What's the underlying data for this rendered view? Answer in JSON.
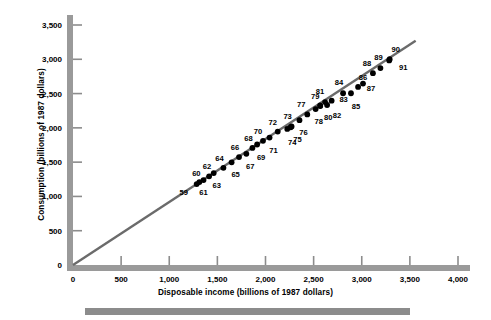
{
  "figure": {
    "x_axis_title": "Disposable income (billions of 1987 dollars)",
    "y_axis_title": "Consumption (billions of 1987 dollars)"
  },
  "colors": {
    "axis_gray": "#9a9a9a",
    "tick_gray": "#8c8c8c",
    "line_gray": "#6b6b6b",
    "marker_black": "#000000",
    "rule_gray": "#8c8c8c",
    "background": "#ffffff"
  },
  "chart_data": {
    "type": "scatter",
    "title": "",
    "xlabel": "Disposable income (billions of 1987 dollars)",
    "ylabel": "Consumption (billions of 1987 dollars)",
    "xlim": [
      0,
      4000
    ],
    "ylim": [
      0,
      3500
    ],
    "xticks": [
      0,
      500,
      1000,
      1500,
      2000,
      2500,
      3000,
      3500,
      4000
    ],
    "yticks": [
      0,
      500,
      1000,
      1500,
      2000,
      2500,
      3000,
      3500
    ],
    "xticklabels": [
      "0",
      "500",
      "1,000",
      "1,500",
      "2,000",
      "2,500",
      "3,000",
      "3,500",
      "4,000"
    ],
    "yticklabels": [
      "0",
      "500",
      "1,000",
      "1,500",
      "2,000",
      "2,500",
      "3,000",
      "3,500"
    ],
    "grid": false,
    "legend": null,
    "point_label_field": "year",
    "trendline": {
      "type": "line",
      "through_origin": true,
      "x": [
        0,
        3560
      ],
      "y": [
        0,
        3270
      ]
    },
    "points": [
      {
        "year": "59",
        "x": 1285,
        "y": 1180,
        "label_dx": -13,
        "label_dy": 8
      },
      {
        "year": "60",
        "x": 1313,
        "y": 1210,
        "label_dx": -3,
        "label_dy": -9
      },
      {
        "year": "61",
        "x": 1356,
        "y": 1238,
        "label_dx": 0,
        "label_dy": 12
      },
      {
        "year": "62",
        "x": 1414,
        "y": 1293,
        "label_dx": -2,
        "label_dy": -10
      },
      {
        "year": "63",
        "x": 1462,
        "y": 1341,
        "label_dx": 3,
        "label_dy": 12
      },
      {
        "year": "64",
        "x": 1563,
        "y": 1417,
        "label_dx": -4,
        "label_dy": -10
      },
      {
        "year": "65",
        "x": 1648,
        "y": 1497,
        "label_dx": 4,
        "label_dy": 12
      },
      {
        "year": "66",
        "x": 1725,
        "y": 1574,
        "label_dx": -4,
        "label_dy": -10
      },
      {
        "year": "67",
        "x": 1801,
        "y": 1622,
        "label_dx": 4,
        "label_dy": 12
      },
      {
        "year": "68",
        "x": 1864,
        "y": 1708,
        "label_dx": -4,
        "label_dy": -10
      },
      {
        "year": "69",
        "x": 1913,
        "y": 1757,
        "label_dx": 4,
        "label_dy": 12
      },
      {
        "year": "70",
        "x": 1974,
        "y": 1811,
        "label_dx": -5,
        "label_dy": -10
      },
      {
        "year": "71",
        "x": 2042,
        "y": 1858,
        "label_dx": 4,
        "label_dy": 12
      },
      {
        "year": "72",
        "x": 2127,
        "y": 1946,
        "label_dx": -5,
        "label_dy": -10
      },
      {
        "year": "73",
        "x": 2261,
        "y": 2009,
        "label_dx": -3,
        "label_dy": -11
      },
      {
        "year": "74",
        "x": 2226,
        "y": 1985,
        "label_dx": 5,
        "label_dy": 13
      },
      {
        "year": "75",
        "x": 2271,
        "y": 2021,
        "label_dx": 6,
        "label_dy": 13
      },
      {
        "year": "76",
        "x": 2353,
        "y": 2112,
        "label_dx": 4,
        "label_dy": 12
      },
      {
        "year": "77",
        "x": 2434,
        "y": 2196,
        "label_dx": -6,
        "label_dy": -10
      },
      {
        "year": "78",
        "x": 2521,
        "y": 2274,
        "label_dx": 3,
        "label_dy": 12
      },
      {
        "year": "79",
        "x": 2568,
        "y": 2326,
        "label_dx": -5,
        "label_dy": -10
      },
      {
        "year": "80",
        "x": 2569,
        "y": 2317,
        "label_dx": 8,
        "label_dy": 11
      },
      {
        "year": "81",
        "x": 2619,
        "y": 2376,
        "label_dx": -5,
        "label_dy": -11
      },
      {
        "year": "82",
        "x": 2640,
        "y": 2333,
        "label_dx": 10,
        "label_dy": 10
      },
      {
        "year": "83",
        "x": 2687,
        "y": 2397,
        "label_dx": 12,
        "label_dy": -2
      },
      {
        "year": "84",
        "x": 2806,
        "y": 2505,
        "label_dx": -4,
        "label_dy": -11
      },
      {
        "year": "85",
        "x": 2888,
        "y": 2505,
        "label_dx": 5,
        "label_dy": 13
      },
      {
        "year": "86",
        "x": 2962,
        "y": 2597,
        "label_dx": 5,
        "label_dy": -10
      },
      {
        "year": "87",
        "x": 3013,
        "y": 2646,
        "label_dx": 8,
        "label_dy": 4
      },
      {
        "year": "88",
        "x": 3116,
        "y": 2797,
        "label_dx": -6,
        "label_dy": -10
      },
      {
        "year": "89",
        "x": 3194,
        "y": 2872,
        "label_dx": -2,
        "label_dy": -11
      },
      {
        "year": "90",
        "x": 3290,
        "y": 3002,
        "label_dx": 6,
        "label_dy": -10
      },
      {
        "year": "91",
        "x": 3285,
        "y": 2983,
        "label_dx": 14,
        "label_dy": 7
      }
    ]
  }
}
